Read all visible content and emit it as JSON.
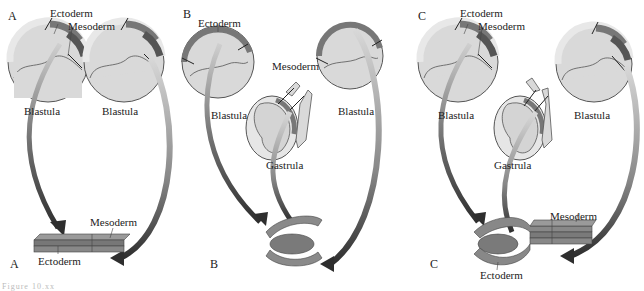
{
  "figure": {
    "panels": [
      {
        "id": "A",
        "top_label": "A",
        "bottom_label": "A",
        "stages": [
          "Blastula",
          "Blastula"
        ],
        "germ_layer_labels": [
          "Ectoderm",
          "Mesoderm"
        ],
        "result_labels": {
          "mesoderm": "Mesoderm",
          "ectoderm": "Ectoderm"
        }
      },
      {
        "id": "B",
        "top_label": "B",
        "bottom_label": "B",
        "stages": [
          "Blastula",
          "Gastrula",
          "Blastula"
        ],
        "germ_layer_labels": [
          "Ectoderm",
          "Mesoderm"
        ]
      },
      {
        "id": "C",
        "top_label": "C",
        "bottom_label": "C",
        "stages": [
          "Blastula",
          "Gastrula",
          "Blastula"
        ],
        "germ_layer_labels": [
          "Ectoderm",
          "Mesoderm"
        ],
        "result_labels": {
          "mesoderm": "Mesoderm",
          "ectoderm": "Ectoderm"
        }
      }
    ],
    "caption_partial": "Figure 10.xx"
  },
  "colors": {
    "embryo_fill": "#d9d9d9",
    "ring_light": "#e6e6e6",
    "ectoderm_dark": "#707070",
    "mesoderm_dark": "#555555",
    "arrow_dark": "#2e2e2e",
    "tissue_mid": "#7a7a7a"
  }
}
